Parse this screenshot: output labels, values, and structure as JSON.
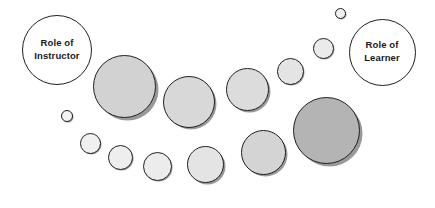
{
  "diagram": {
    "type": "continuum-of-responsibility",
    "canvas": {
      "width": 435,
      "height": 208,
      "background": "#ffffff"
    },
    "style": {
      "endpoint_fill": "#ffffff",
      "endpoint_stroke": "#231f20",
      "gray_fill_large": "#b4b4b4",
      "gray_fill_medium": "#d2d2d2",
      "gray_fill_small": "#eeeeee",
      "stroke_color": "#231f20",
      "shadow_color": "#55555599",
      "label_color": "#1a1a1a"
    },
    "endpoints": [
      {
        "id": "role-of-instructor",
        "name": "instructor-circle",
        "label_lines": [
          "Role of",
          "Instructor"
        ],
        "cx": 57,
        "cy": 50,
        "d": 70,
        "fill": "#ffffff",
        "stroke": "#231f20",
        "stroke_width": 1.6,
        "font_size": 9.5,
        "shadow": false
      },
      {
        "id": "role-of-learner",
        "name": "learner-circle",
        "label_lines": [
          "Role of",
          "Learner"
        ],
        "cx": 382,
        "cy": 52,
        "d": 67,
        "fill": "#ffffff",
        "stroke": "#231f20",
        "stroke_width": 1.6,
        "font_size": 9.5,
        "shadow": false
      }
    ],
    "instructor_series": {
      "name": "instructor-responsibility-series",
      "description": "Circles decreasing in size from left to right",
      "circles": [
        {
          "id": "inst-1",
          "cx": 124,
          "cy": 86,
          "d": 63,
          "fill": "#d2d2d2",
          "stroke_width": 1.7
        },
        {
          "id": "inst-2",
          "cx": 189,
          "cy": 102,
          "d": 52,
          "fill": "#d8d8d8",
          "stroke_width": 1.6
        },
        {
          "id": "inst-3",
          "cx": 247,
          "cy": 89,
          "d": 43,
          "fill": "#dcdcdc",
          "stroke_width": 1.5
        },
        {
          "id": "inst-4",
          "cx": 290,
          "cy": 71,
          "d": 27,
          "fill": "#e4e4e4",
          "stroke_width": 1.4
        },
        {
          "id": "inst-5",
          "cx": 323,
          "cy": 48,
          "d": 21,
          "fill": "#ebebeb",
          "stroke_width": 1.3
        },
        {
          "id": "inst-6",
          "cx": 340,
          "cy": 13,
          "d": 11,
          "fill": "#f0f0f0",
          "stroke_width": 1.1
        }
      ]
    },
    "learner_series": {
      "name": "learner-responsibility-series",
      "description": "Circles increasing in size from left to right",
      "circles": [
        {
          "id": "learn-1",
          "cx": 67,
          "cy": 116,
          "d": 12,
          "fill": "#f2f2f2",
          "stroke_width": 1.1
        },
        {
          "id": "learn-2",
          "cx": 90,
          "cy": 143,
          "d": 21,
          "fill": "#f0f0f0",
          "stroke_width": 1.3
        },
        {
          "id": "learn-3",
          "cx": 120,
          "cy": 157,
          "d": 25,
          "fill": "#eeeeee",
          "stroke_width": 1.4
        },
        {
          "id": "learn-4",
          "cx": 157,
          "cy": 166,
          "d": 29,
          "fill": "#ececec",
          "stroke_width": 1.4
        },
        {
          "id": "learn-5",
          "cx": 205,
          "cy": 164,
          "d": 37,
          "fill": "#e4e4e4",
          "stroke_width": 1.5
        },
        {
          "id": "learn-6",
          "cx": 263,
          "cy": 152,
          "d": 45,
          "fill": "#d4d4d4",
          "stroke_width": 1.6
        },
        {
          "id": "learn-7",
          "cx": 326,
          "cy": 130,
          "d": 67,
          "fill": "#b4b4b4",
          "stroke_width": 1.8
        }
      ]
    }
  }
}
